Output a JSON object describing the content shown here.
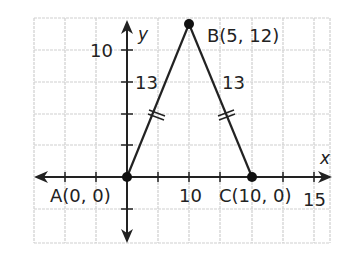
{
  "diagram": {
    "axes": {
      "x_label": "x",
      "y_label": "y"
    },
    "tick_labels": {
      "y_10": "10",
      "x_10": "10",
      "x_15": "15"
    },
    "points": {
      "A": {
        "label": "A(0, 0)"
      },
      "B": {
        "label": "B(5, 12)"
      },
      "C": {
        "label": "C(10, 0)"
      }
    },
    "sides": {
      "AB": {
        "length": "13",
        "tick_marks": 2
      },
      "BC": {
        "length": "13",
        "tick_marks": 2
      }
    },
    "colors": {
      "grid": "#c8c8c8",
      "lines": "#222222",
      "background": "#ffffff"
    }
  }
}
